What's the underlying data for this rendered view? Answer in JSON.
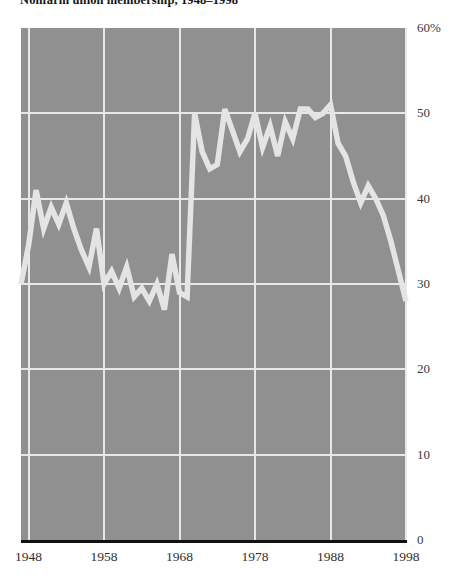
{
  "chart_data": {
    "type": "line",
    "title": "Nonfarm union membership, 1948–1998",
    "xlabel": "",
    "ylabel": "",
    "ylim": [
      0,
      60
    ],
    "xlim": [
      1947,
      1998
    ],
    "grid": true,
    "legend": null,
    "y_ticks": [
      {
        "value": 60,
        "label": "60%"
      },
      {
        "value": 50,
        "label": "50"
      },
      {
        "value": 40,
        "label": "40"
      },
      {
        "value": 30,
        "label": "30"
      },
      {
        "value": 20,
        "label": "20"
      },
      {
        "value": 10,
        "label": "10"
      },
      {
        "value": 0,
        "label": "0"
      }
    ],
    "x_ticks": [
      {
        "value": 1948,
        "label": "1948"
      },
      {
        "value": 1958,
        "label": "1958"
      },
      {
        "value": 1968,
        "label": "1968"
      },
      {
        "value": 1978,
        "label": "1978"
      },
      {
        "value": 1988,
        "label": "1988"
      },
      {
        "value": 1998,
        "label": "1998"
      }
    ],
    "colors": {
      "plot_background": "#909090",
      "gridline": "#e8e8e8",
      "data_line": "#e4e4e4",
      "axis_baseline": "#111111",
      "page_background": "#ffffff",
      "tick_label": "#3a3a3a",
      "title": "#141414"
    },
    "x": [
      1947,
      1948,
      1949,
      1950,
      1951,
      1952,
      1953,
      1954,
      1955,
      1956,
      1957,
      1958,
      1959,
      1960,
      1961,
      1962,
      1963,
      1964,
      1965,
      1966,
      1967,
      1968,
      1969,
      1970,
      1971,
      1972,
      1973,
      1974,
      1975,
      1976,
      1977,
      1978,
      1979,
      1980,
      1981,
      1982,
      1983,
      1984,
      1985,
      1986,
      1987,
      1988,
      1989,
      1990,
      1991,
      1992,
      1993,
      1994,
      1995,
      1996,
      1997,
      1998
    ],
    "values": [
      30.0,
      34.5,
      41.0,
      36.5,
      39.0,
      37.0,
      39.5,
      36.5,
      34.0,
      32.0,
      36.5,
      30.0,
      31.5,
      29.5,
      32.0,
      28.5,
      29.5,
      28.0,
      30.0,
      27.0,
      33.5,
      29.0,
      28.5,
      50.0,
      45.5,
      43.5,
      44.0,
      50.5,
      48.0,
      45.5,
      47.0,
      50.0,
      46.0,
      48.5,
      45.0,
      49.0,
      47.0,
      50.5,
      50.5,
      49.5,
      50.0,
      51.0,
      46.5,
      45.0,
      42.0,
      39.5,
      41.5,
      40.0,
      38.0,
      35.0,
      31.5,
      28.0
    ],
    "series_name": "Nonfarm union membership"
  }
}
